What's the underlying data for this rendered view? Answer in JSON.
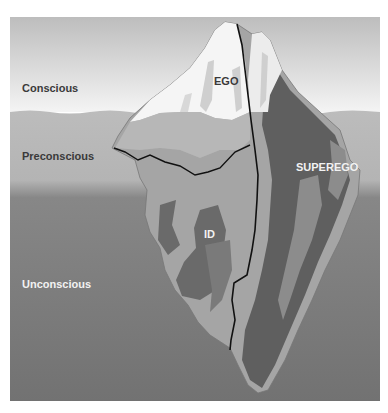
{
  "diagram": {
    "levels": [
      {
        "label": "Conscious"
      },
      {
        "label": "Preconscious"
      },
      {
        "label": "Unconscious"
      }
    ],
    "structures": [
      {
        "label": "EGO"
      },
      {
        "label": "SUPEREGO"
      },
      {
        "label": "ID"
      }
    ],
    "colors": {
      "sky_top": "#bdbdbd",
      "sky_bottom": "#f4f4f4",
      "preconscious_water": "#b9b9b9",
      "unconscious_water": "#7a7a7a",
      "ice_light": "#f7f7f7",
      "ice_mid": "#9a9a9a",
      "ice_dark": "#5e5e5e",
      "divider_line": "#111111"
    }
  }
}
